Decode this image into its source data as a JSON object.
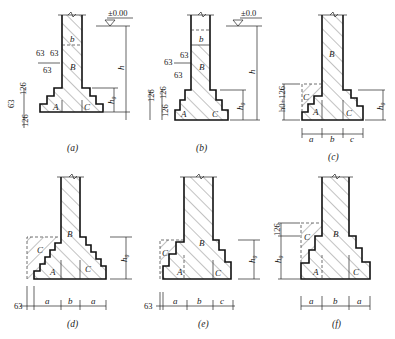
{
  "figure": {
    "panels": [
      {
        "id": "a",
        "caption": "(a)",
        "elevation": "±0.00",
        "zone_labels": [
          "A",
          "B",
          "C"
        ],
        "width_label": "b",
        "height_label": "h",
        "effective_depth_label": "h0",
        "step_dims": [
          "126",
          "63",
          "126"
        ],
        "offset_dims": [
          "63",
          "63",
          "63"
        ]
      },
      {
        "id": "b",
        "caption": "(b)",
        "elevation": "±0.0",
        "zone_labels": [
          "A",
          "B",
          "C"
        ],
        "width_label": "b",
        "height_label": "h",
        "effective_depth_label": "h0",
        "step_dims": [
          "126",
          "126",
          "126"
        ],
        "offset_dims": [
          "63",
          "63",
          "63"
        ]
      },
      {
        "id": "c",
        "caption": "(c)",
        "zone_labels": [
          "A",
          "B",
          "C",
          "C"
        ],
        "effective_depth_label": "h0",
        "left_dim": "h0+126",
        "bottom_dims": [
          "a",
          "b",
          "c"
        ]
      },
      {
        "id": "d",
        "caption": "(d)",
        "zone_labels": [
          "A",
          "B",
          "C",
          "C"
        ],
        "effective_depth_label": "h0",
        "offset": "63",
        "bottom_dims": [
          "a",
          "b",
          "a"
        ]
      },
      {
        "id": "e",
        "caption": "(e)",
        "zone_labels": [
          "A",
          "B",
          "C",
          "C"
        ],
        "effective_depth_label": "h0",
        "offset": "63",
        "bottom_dims": [
          "a",
          "b",
          "c"
        ]
      },
      {
        "id": "f",
        "caption": "(f)",
        "zone_labels": [
          "A",
          "B",
          "C",
          "C"
        ],
        "effective_depth_label": "h0",
        "top_dim": "126",
        "bottom_dims": [
          "a",
          "b",
          "a"
        ]
      }
    ]
  }
}
